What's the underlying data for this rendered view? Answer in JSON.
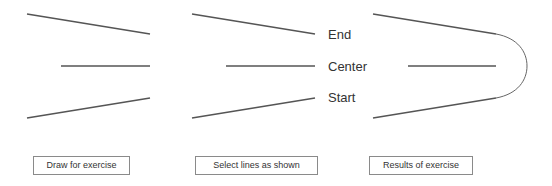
{
  "panels": [
    {
      "id": "draw",
      "caption": "Draw for exercise",
      "has_fillet_arc": false
    },
    {
      "id": "select",
      "caption": "Select lines as shown",
      "labels": [
        "End",
        "Center",
        "Start"
      ],
      "has_fillet_arc": false
    },
    {
      "id": "results",
      "caption": "Results of exercise",
      "has_fillet_arc": true
    }
  ],
  "line_color": "#555555",
  "arc_color": "#666666"
}
